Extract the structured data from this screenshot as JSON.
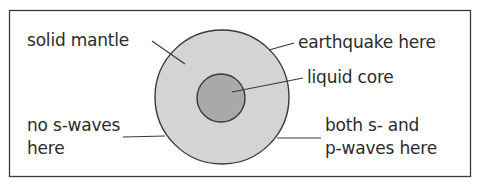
{
  "diagram": {
    "labels": {
      "solid_mantle": "solid mantle",
      "earthquake": "earthquake here",
      "liquid_core": "liquid core",
      "no_s_waves_line1": "no s-waves",
      "no_s_waves_line2": "here",
      "both_waves_line1": "both s- and",
      "both_waves_line2": "p-waves here"
    },
    "colors": {
      "frame": "#3a3a3a",
      "mantle_fill": "#d4d4d4",
      "core_fill": "#a9a9a9",
      "outline": "#3a3a3a",
      "text": "#2b2b2b",
      "background": "#ffffff"
    }
  }
}
